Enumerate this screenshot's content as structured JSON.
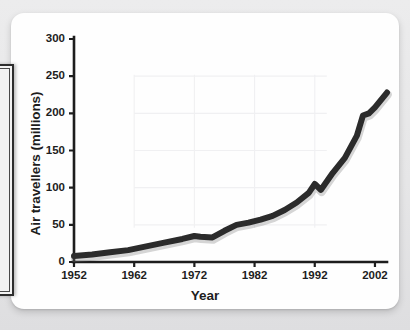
{
  "card": {
    "background_color": "#fefefe",
    "page_background_color": "#e9e9e9"
  },
  "left_fragment": {
    "name": "adjacent-panel-fragment",
    "border_color": "#2e2e2e"
  },
  "chart_data": {
    "type": "line",
    "title": "",
    "xlabel": "Year",
    "ylabel": "Air travellers (millions)",
    "xlim": [
      1952,
      2004
    ],
    "ylim": [
      0,
      300
    ],
    "grid": true,
    "grid_color": "#f0f0f2",
    "legend": "none",
    "line_color": "#2b2b2b",
    "line_width": 6,
    "x_tick_labels": [
      "1952",
      "1962",
      "1972",
      "1982",
      "1992",
      "2002"
    ],
    "x_ticks": [
      1952,
      1962,
      1972,
      1982,
      1992,
      2002
    ],
    "x_minor_ticks": [
      1952,
      1962,
      1972,
      1982,
      1992,
      2002
    ],
    "y_tick_labels": [
      "0",
      "50",
      "100",
      "150",
      "200",
      "250",
      "300"
    ],
    "y_ticks": [
      0,
      50,
      100,
      150,
      200,
      250,
      300
    ],
    "series": [
      {
        "name": "Air travellers",
        "x": [
          1952,
          1955,
          1958,
          1961,
          1964,
          1967,
          1970,
          1972,
          1973,
          1975,
          1977,
          1979,
          1981,
          1983,
          1985,
          1987,
          1989,
          1991,
          1992,
          1993,
          1995,
          1997,
          1999,
          2000,
          2001,
          2002,
          2004
        ],
        "values": [
          8,
          10,
          13,
          16,
          21,
          26,
          31,
          35,
          34,
          33,
          42,
          50,
          53,
          57,
          62,
          70,
          80,
          93,
          105,
          97,
          120,
          140,
          170,
          197,
          200,
          208,
          228
        ]
      }
    ]
  }
}
